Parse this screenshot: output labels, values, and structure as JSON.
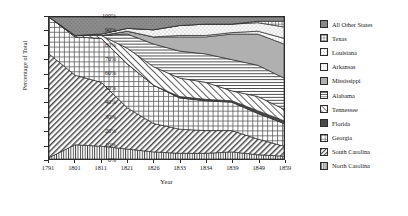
{
  "chart_data": {
    "type": "area",
    "stacked": true,
    "normalized": true,
    "title": "",
    "xlabel": "Year",
    "ylabel": "Percentage of Total",
    "x": [
      1791,
      1801,
      1811,
      1821,
      1826,
      1833,
      1834,
      1839,
      1849,
      1859
    ],
    "xticklabels": [
      "1791",
      "1801",
      "1811",
      "1821",
      "1826",
      "1833",
      "1834",
      "1839",
      "1849",
      "1859"
    ],
    "yticklabels": [
      "0%",
      "10%",
      "20%",
      "30%",
      "40%",
      "50%",
      "60%",
      "70%",
      "80%",
      "90%",
      "100%"
    ],
    "ylim": [
      0,
      100
    ],
    "ytick_step": 10,
    "grid": false,
    "legend_position": "right",
    "series": [
      {
        "name": "North Carolina",
        "pattern": "vertical-lines",
        "values": [
          1,
          10,
          9,
          7,
          5,
          4,
          4,
          5,
          3,
          2
        ]
      },
      {
        "name": "South Carolina",
        "pattern": "diagonal-lines-left",
        "values": [
          73,
          49,
          45,
          29,
          20,
          17,
          16,
          15,
          11,
          7
        ]
      },
      {
        "name": "Georgia",
        "pattern": "crosshatch-grid",
        "values": [
          26,
          27,
          31,
          31,
          27,
          22,
          21,
          20,
          18,
          16
        ]
      },
      {
        "name": "Florida",
        "pattern": "solid-dark",
        "values": [
          0,
          0,
          0,
          0,
          0,
          1,
          1,
          1,
          2,
          2
        ]
      },
      {
        "name": "Tennessee",
        "pattern": "diagonal-sparse",
        "values": [
          0,
          1,
          2,
          11,
          13,
          13,
          12,
          7,
          10,
          8
        ]
      },
      {
        "name": "Alabama",
        "pattern": "horizontal-lines",
        "values": [
          0,
          0,
          0,
          10,
          16,
          19,
          20,
          22,
          22,
          22
        ]
      },
      {
        "name": "Mississippi",
        "pattern": "solid-gray",
        "values": [
          0,
          0,
          0,
          2,
          5,
          10,
          12,
          18,
          22,
          24
        ]
      },
      {
        "name": "Arkansas",
        "pattern": "fine-dots",
        "values": [
          0,
          0,
          0,
          0,
          0,
          1,
          1,
          1,
          2,
          4
        ]
      },
      {
        "name": "Louisiana",
        "pattern": "sparse-dots",
        "values": [
          0,
          0,
          1,
          2,
          5,
          7,
          8,
          6,
          6,
          8
        ]
      },
      {
        "name": "Texas",
        "pattern": "small-grid",
        "values": [
          0,
          0,
          0,
          0,
          0,
          0,
          0,
          0,
          1,
          4
        ]
      },
      {
        "name": "All Other States",
        "pattern": "solid-medium-gray",
        "values": [
          0,
          13,
          12,
          8,
          9,
          6,
          5,
          5,
          3,
          3
        ]
      }
    ]
  },
  "legend": {
    "items": [
      {
        "label": "All Other States",
        "swatch": "solid-medium-gray"
      },
      {
        "label": "Texas",
        "swatch": "small-grid"
      },
      {
        "label": "Louisiana",
        "swatch": "sparse-dots"
      },
      {
        "label": "Arkansas",
        "swatch": "fine-dots"
      },
      {
        "label": "Mississippi",
        "swatch": "solid-gray"
      },
      {
        "label": "Alabama",
        "swatch": "horizontal-lines"
      },
      {
        "label": "Tennessee",
        "swatch": "diagonal-sparse"
      },
      {
        "label": "Florida",
        "swatch": "solid-dark"
      },
      {
        "label": "Georgia",
        "swatch": "crosshatch-grid"
      },
      {
        "label": "South Carolina",
        "swatch": "diagonal-lines-left"
      },
      {
        "label": "North Carolina",
        "swatch": "vertical-lines"
      }
    ]
  },
  "colors": {
    "axis": "#2b2b2b",
    "text": "#1a1a1a",
    "background": "#ffffff",
    "all_other_states": "#8c8c8c",
    "mississippi": "#b3b3b3",
    "florida": "#4d4d4d"
  }
}
